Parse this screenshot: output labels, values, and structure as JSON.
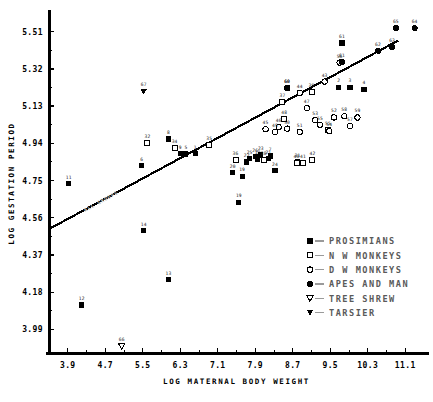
{
  "chart_data": {
    "type": "scatter",
    "title": "",
    "xlabel": "LOG MATERNAL BODY WEIGHT",
    "ylabel": "LOG GESTATION PERIOD",
    "xlim": [
      3.5,
      11.5
    ],
    "ylim": [
      3.87,
      5.6
    ],
    "xticks": [
      3.9,
      4.7,
      5.5,
      6.3,
      7.1,
      7.9,
      8.7,
      9.5,
      10.3,
      11.1
    ],
    "yticks": [
      3.99,
      4.18,
      4.37,
      4.56,
      4.75,
      4.94,
      5.13,
      5.32,
      5.51
    ],
    "xtick_labels": [
      "3.9",
      "4.7",
      "5.5",
      "6.3",
      "7.1",
      "7.9",
      "8.7",
      "9.5",
      "10.3",
      "11.1"
    ],
    "ytick_labels": [
      "3.99",
      "4.18",
      "4.37",
      "4.56",
      "4.75",
      "4.94",
      "5.13",
      "5.32",
      "5.51"
    ],
    "grid": false,
    "legend_position": "center-right",
    "regression_line": {
      "label": "ALL GROUPS",
      "x0": 3.52,
      "y0": 4.505,
      "x1": 10.95,
      "y1": 5.465
    },
    "legend": [
      {
        "label": "PROSIMIANS",
        "marker": "filled-square"
      },
      {
        "label": "N W MONKEYS",
        "marker": "open-square"
      },
      {
        "label": "D W MONKEYS",
        "marker": "open-circle"
      },
      {
        "label": "APES AND MAN",
        "marker": "filled-circle"
      },
      {
        "label": "TREE SHREW",
        "marker": "open-triangle-down"
      },
      {
        "label": "TARSIER",
        "marker": "filled-triangle-down"
      }
    ],
    "series": [
      {
        "name": "PROSIMIANS",
        "marker": "filled-square",
        "points": [
          {
            "id": "1",
            "x": 6.62,
            "y": 4.888
          },
          {
            "id": "2",
            "x": 9.68,
            "y": 5.225
          },
          {
            "id": "3",
            "x": 9.92,
            "y": 5.225
          },
          {
            "id": "4",
            "x": 10.22,
            "y": 5.215
          },
          {
            "id": "5",
            "x": 6.42,
            "y": 4.886
          },
          {
            "id": "6",
            "x": 5.48,
            "y": 4.826
          },
          {
            "id": "7",
            "x": 8.22,
            "y": 4.875
          },
          {
            "id": "8",
            "x": 6.05,
            "y": 4.962
          },
          {
            "id": "9",
            "x": 6.3,
            "y": 4.888
          },
          {
            "id": "11",
            "x": 3.92,
            "y": 4.735
          },
          {
            "id": "12",
            "x": 4.2,
            "y": 4.115
          },
          {
            "id": "13",
            "x": 6.05,
            "y": 4.245
          },
          {
            "id": "14",
            "x": 5.52,
            "y": 4.495
          },
          {
            "id": "18",
            "x": 7.95,
            "y": 4.86
          },
          {
            "id": "19",
            "x": 7.62,
            "y": 4.772
          },
          {
            "id": "20",
            "x": 7.42,
            "y": 4.79
          },
          {
            "id": "21",
            "x": 8.18,
            "y": 4.862
          },
          {
            "id": "22",
            "x": 7.72,
            "y": 4.845
          },
          {
            "id": "23",
            "x": 8.02,
            "y": 4.88
          },
          {
            "id": "24",
            "x": 8.32,
            "y": 4.8
          },
          {
            "id": "25",
            "x": 7.78,
            "y": 4.862
          },
          {
            "id": "26",
            "x": 7.9,
            "y": 4.872
          },
          {
            "id": "19b",
            "x": 7.55,
            "y": 4.64
          },
          {
            "id": "31",
            "x": 8.8,
            "y": 4.845
          },
          {
            "id": "60",
            "x": 8.58,
            "y": 5.222
          },
          {
            "id": "61",
            "x": 9.75,
            "y": 5.452
          }
        ]
      },
      {
        "name": "N W MONKEYS",
        "marker": "open-square",
        "points": [
          {
            "id": "32",
            "x": 5.6,
            "y": 4.94
          },
          {
            "id": "34",
            "x": 6.18,
            "y": 4.918
          },
          {
            "id": "35",
            "x": 6.92,
            "y": 4.932
          },
          {
            "id": "36",
            "x": 7.48,
            "y": 4.855
          },
          {
            "id": "37",
            "x": 8.48,
            "y": 5.15
          },
          {
            "id": "38",
            "x": 8.08,
            "y": 4.855
          },
          {
            "id": "39",
            "x": 9.1,
            "y": 5.2
          },
          {
            "id": "40",
            "x": 8.78,
            "y": 4.838
          },
          {
            "id": "41",
            "x": 8.92,
            "y": 4.838
          },
          {
            "id": "42",
            "x": 9.12,
            "y": 4.855
          },
          {
            "id": "48",
            "x": 8.52,
            "y": 5.062
          },
          {
            "id": "55",
            "x": 9.45,
            "y": 5.01
          }
        ]
      },
      {
        "name": "D W MONKEYS",
        "marker": "open-circle",
        "points": [
          {
            "id": "43",
            "x": 9.38,
            "y": 5.255
          },
          {
            "id": "44",
            "x": 8.85,
            "y": 5.198
          },
          {
            "id": "45",
            "x": 8.12,
            "y": 5.012
          },
          {
            "id": "46",
            "x": 8.4,
            "y": 5.022
          },
          {
            "id": "47",
            "x": 9.0,
            "y": 5.12
          },
          {
            "id": "49",
            "x": 8.32,
            "y": 4.998
          },
          {
            "id": "50",
            "x": 8.58,
            "y": 5.015
          },
          {
            "id": "51",
            "x": 8.85,
            "y": 4.998
          },
          {
            "id": "52",
            "x": 9.58,
            "y": 5.072
          },
          {
            "id": "53",
            "x": 9.18,
            "y": 5.058
          },
          {
            "id": "54",
            "x": 9.48,
            "y": 5.002
          },
          {
            "id": "55b",
            "x": 9.28,
            "y": 5.035
          },
          {
            "id": "56",
            "x": 9.7,
            "y": 5.352
          },
          {
            "id": "57",
            "x": 9.92,
            "y": 5.028
          },
          {
            "id": "58",
            "x": 9.8,
            "y": 5.078
          },
          {
            "id": "59",
            "x": 10.08,
            "y": 5.072
          }
        ]
      },
      {
        "name": "APES AND MAN",
        "marker": "filled-circle",
        "points": [
          {
            "id": "60b",
            "x": 8.58,
            "y": 5.222
          },
          {
            "id": "61b",
            "x": 9.75,
            "y": 5.355
          },
          {
            "id": "62",
            "x": 10.52,
            "y": 5.412
          },
          {
            "id": "63",
            "x": 10.82,
            "y": 5.432
          },
          {
            "id": "64",
            "x": 11.3,
            "y": 5.528
          },
          {
            "id": "65",
            "x": 10.9,
            "y": 5.528
          }
        ]
      },
      {
        "name": "TREE SHREW",
        "marker": "open-triangle-down",
        "points": [
          {
            "id": "66",
            "x": 5.05,
            "y": 3.905
          }
        ]
      },
      {
        "name": "TARSIER",
        "marker": "filled-triangle-down",
        "points": [
          {
            "id": "67",
            "x": 5.52,
            "y": 5.205
          }
        ]
      }
    ]
  },
  "footer": {
    "caption_fragment": ""
  }
}
